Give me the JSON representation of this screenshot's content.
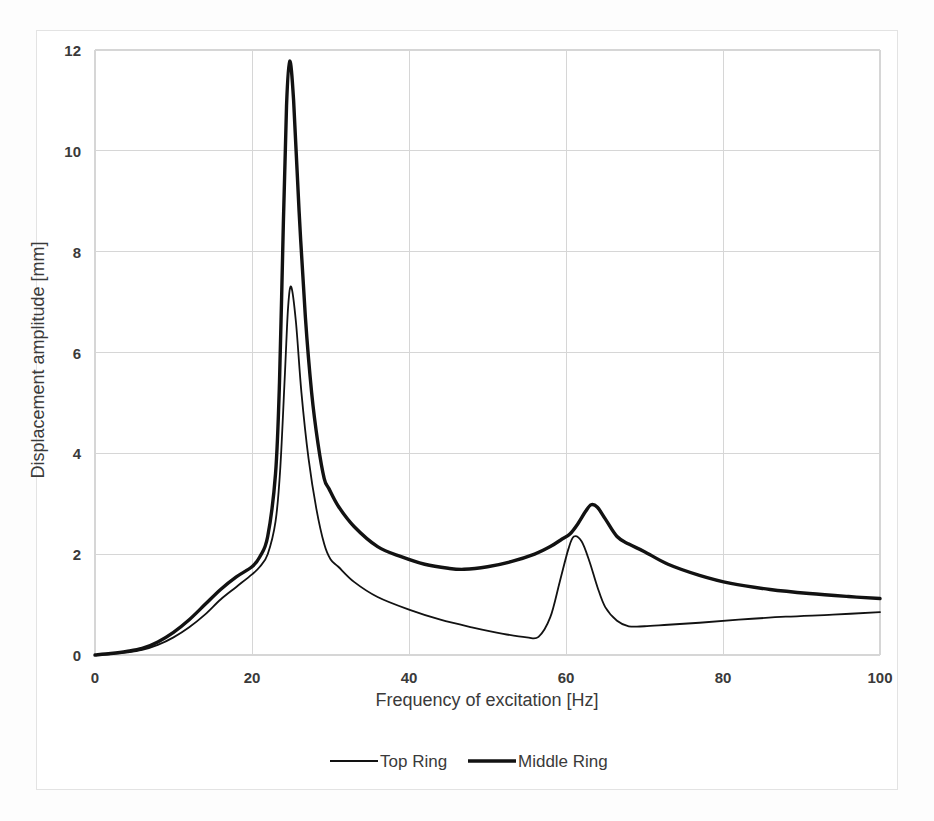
{
  "chart_data": {
    "type": "line",
    "title": "",
    "xlabel": "Frequency of excitation [Hz]",
    "ylabel": "Displacement amplitude [mm]",
    "xlim": [
      0,
      100
    ],
    "ylim": [
      0,
      12
    ],
    "xticks": [
      0,
      20,
      40,
      60,
      80,
      100
    ],
    "yticks": [
      0,
      2,
      4,
      6,
      8,
      10,
      12
    ],
    "grid": true,
    "legend_position": "bottom",
    "series": [
      {
        "name": "Top Ring",
        "line_width": 1.8,
        "color": "#121212",
        "x": [
          0,
          2,
          4,
          6,
          8,
          10,
          12,
          14,
          16,
          18,
          20,
          21,
          22,
          23,
          23.6,
          24.2,
          24.6,
          25,
          25.6,
          26.3,
          27.2,
          28.2,
          29.2,
          30,
          31,
          33,
          36,
          40,
          44,
          48,
          52,
          55,
          56.5,
          58,
          59.2,
          60.3,
          61,
          62,
          63,
          64,
          65,
          66.5,
          68,
          70,
          73,
          77,
          82,
          88,
          94,
          100
        ],
        "y": [
          0.0,
          0.02,
          0.05,
          0.1,
          0.2,
          0.35,
          0.55,
          0.8,
          1.1,
          1.35,
          1.6,
          1.75,
          2.0,
          2.65,
          3.7,
          5.6,
          6.9,
          7.3,
          6.6,
          5.2,
          3.9,
          2.9,
          2.2,
          1.9,
          1.75,
          1.45,
          1.15,
          0.9,
          0.7,
          0.55,
          0.42,
          0.35,
          0.36,
          0.75,
          1.45,
          2.1,
          2.35,
          2.25,
          1.85,
          1.35,
          0.95,
          0.68,
          0.57,
          0.57,
          0.6,
          0.64,
          0.7,
          0.76,
          0.8,
          0.85
        ]
      },
      {
        "name": "Middle Ring",
        "line_width": 3.4,
        "color": "#121212",
        "x": [
          0,
          2,
          4,
          6,
          8,
          10,
          12,
          14,
          16,
          18,
          20,
          21,
          22,
          23,
          23.5,
          24.0,
          24.4,
          24.8,
          25.3,
          26.0,
          26.8,
          27.6,
          28.4,
          29.2,
          29.8,
          31,
          33,
          36,
          39,
          42,
          45,
          47,
          50,
          53,
          56,
          58,
          59.5,
          60.5,
          61.5,
          62.5,
          63.2,
          64,
          65,
          66.5,
          68,
          70,
          73,
          77,
          81,
          86,
          91,
          96,
          100
        ],
        "y": [
          0.0,
          0.03,
          0.07,
          0.13,
          0.26,
          0.45,
          0.7,
          1.0,
          1.3,
          1.55,
          1.75,
          1.95,
          2.35,
          3.6,
          5.4,
          8.6,
          10.9,
          11.78,
          11.0,
          8.8,
          6.7,
          5.2,
          4.2,
          3.5,
          3.3,
          2.95,
          2.55,
          2.15,
          1.95,
          1.8,
          1.72,
          1.7,
          1.75,
          1.85,
          2.0,
          2.15,
          2.3,
          2.4,
          2.6,
          2.85,
          2.98,
          2.93,
          2.7,
          2.35,
          2.2,
          2.05,
          1.8,
          1.58,
          1.42,
          1.3,
          1.22,
          1.16,
          1.12
        ]
      }
    ]
  },
  "legend": {
    "items": [
      {
        "label": "Top Ring"
      },
      {
        "label": "Middle Ring"
      }
    ]
  },
  "axes": {
    "x_tick_labels": [
      "0",
      "20",
      "40",
      "60",
      "80",
      "100"
    ],
    "y_tick_labels": [
      "0",
      "2",
      "4",
      "6",
      "8",
      "10",
      "12"
    ],
    "x_title": "Frequency of excitation [Hz]",
    "y_title": "Displacement amplitude [mm]"
  },
  "colors": {
    "line": "#121212",
    "grid": "#d6d6d6",
    "frame": "#e3e3e3",
    "text": "#3a3a3a",
    "background": "#ffffff"
  }
}
